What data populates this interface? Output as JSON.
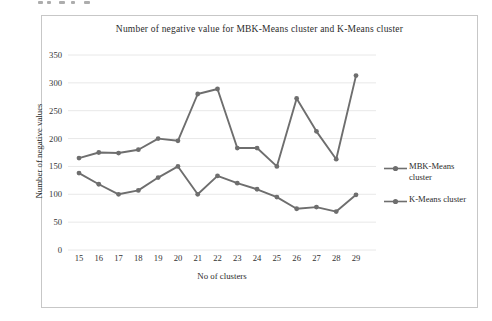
{
  "figure": {
    "title": "Number of negative value for MBK-Means  cluster and K-Means cluster",
    "x_axis": {
      "label": "No of clusters"
    },
    "y_axis": {
      "label": "Number of negative values"
    },
    "legend": [
      {
        "label": "MBK-Means cluster"
      },
      {
        "label": "K-Means cluster"
      }
    ]
  },
  "chart_data": {
    "type": "line",
    "title": "Number of negative value for MBK-Means  cluster and K-Means cluster",
    "xlabel": "No of clusters",
    "ylabel": "Number of negative values",
    "x": [
      15,
      16,
      17,
      18,
      19,
      20,
      21,
      22,
      23,
      24,
      25,
      26,
      27,
      28,
      29
    ],
    "series": [
      {
        "name": "MBK-Means cluster",
        "color": "#6e6e6e",
        "values": [
          165,
          175,
          174,
          180,
          200,
          196,
          280,
          289,
          183,
          183,
          150,
          272,
          213,
          163,
          313
        ]
      },
      {
        "name": "K-Means cluster",
        "color": "#6e6e6e",
        "values": [
          138,
          118,
          100,
          107,
          130,
          150,
          100,
          133,
          120,
          109,
          95,
          74,
          77,
          69,
          99
        ]
      }
    ],
    "ylim": [
      0,
      350
    ],
    "ytick_step": 50,
    "grid": true,
    "grid_color": "#e8e8e8",
    "legend_position": "right",
    "marker": "circle"
  }
}
